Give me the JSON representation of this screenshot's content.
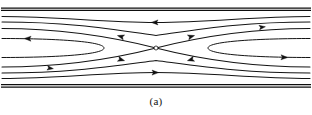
{
  "figure": {
    "caption": "(a)",
    "colors": {
      "background": "#ffffff",
      "stroke": "#141414",
      "wall": "#0d0d0d",
      "arrow": "#101010",
      "null_point_fill": "#ffffff"
    },
    "canvas": {
      "width": 312,
      "height": 97
    },
    "null_point": {
      "x": 156,
      "y": 48,
      "radius": 2.0,
      "label": "X-point"
    },
    "walls": [
      {
        "name": "top-wall-outer",
        "y": 8.0,
        "thickness": 1.25
      },
      {
        "name": "top-wall-inner",
        "y": 10.3,
        "thickness": 1.25
      },
      {
        "name": "bottom-wall-inner",
        "y": 84.6,
        "thickness": 1.25
      },
      {
        "name": "bottom-wall-outer",
        "y": 87.0,
        "thickness": 1.25
      }
    ],
    "streamlines": [
      {
        "name": "upper-outer-streamline",
        "d": "M 2,16.5 C 60,16.5 100,22.5 156,22.5 C 212,22.5 252,16.5 310,16.5",
        "direction": "leftward"
      },
      {
        "name": "upper-separatrix-left",
        "d": "M 2,28.5 C 55,28.5 105,35.0 156,48.0",
        "direction": "leftward"
      },
      {
        "name": "upper-separatrix-right",
        "d": "M 156,48.0 C 207,35.0 257,28.5 310,28.5",
        "direction": "rightward"
      },
      {
        "name": "lower-separatrix-left",
        "d": "M 2,67.0 C 55,67.0 105,61.0 156,48.0",
        "direction": "rightward"
      },
      {
        "name": "lower-separatrix-right",
        "d": "M 156,48.0 C 207,61.0 257,67.0 310,67.0",
        "direction": "leftward"
      },
      {
        "name": "lower-outer-streamline",
        "d": "M 2,78.5 C 60,78.5 100,72.5 156,72.5 C 212,72.5 252,78.5 310,78.5",
        "direction": "rightward"
      },
      {
        "name": "upper-mid-streamline",
        "d": "M 2,22.0 C 70,22.0 110,29.0 156,35.5 C 202,29.0 242,22.0 310,22.0",
        "direction": "leftward"
      },
      {
        "name": "lower-mid-streamline",
        "d": "M 2,73.0 C 70,73.0 110,66.5 156,60.5 C 202,66.5 242,73.0 310,73.0",
        "direction": "rightward"
      }
    ],
    "recirculation_loops": [
      {
        "name": "left-loop",
        "d": "M 2,38.5 C 50,38.5 104,41.0 104,48.0 C 104,55.0 50,57.5 2,57.5",
        "side": "left"
      },
      {
        "name": "right-loop",
        "d": "M 310,38.5 C 262,38.5 208,41.0 208,48.0 C 208,55.0 262,57.5 310,57.5",
        "side": "right"
      }
    ],
    "arrows": [
      {
        "name": "arrow-top-center",
        "x": 155,
        "y": 22.4,
        "angle": 180,
        "size": 6.0,
        "on": "upper-outer-streamline"
      },
      {
        "name": "arrow-bottom-center",
        "x": 155,
        "y": 72.6,
        "angle": 0,
        "size": 6.0,
        "on": "lower-outer-streamline"
      },
      {
        "name": "arrow-upper-left-inflow",
        "x": 121,
        "y": 36.6,
        "angle": 196,
        "size": 6.0,
        "on": "upper-separatrix-left"
      },
      {
        "name": "arrow-upper-right-outflow",
        "x": 191,
        "y": 36.6,
        "angle": 344,
        "size": 6.0,
        "on": "upper-separatrix-right"
      },
      {
        "name": "arrow-lower-left-outflow",
        "x": 121,
        "y": 59.6,
        "angle": 16,
        "size": 6.0,
        "on": "lower-separatrix-left"
      },
      {
        "name": "arrow-lower-right-inflow",
        "x": 191,
        "y": 59.6,
        "angle": 164,
        "size": 6.0,
        "on": "lower-separatrix-right"
      },
      {
        "name": "arrow-left-loop-return",
        "x": 28,
        "y": 38.6,
        "angle": 182,
        "size": 6.0,
        "on": "left-loop"
      },
      {
        "name": "arrow-right-loop-return",
        "x": 284,
        "y": 57.4,
        "angle": 2,
        "size": 6.0,
        "on": "right-loop"
      },
      {
        "name": "arrow-upper-right-far",
        "x": 262,
        "y": 27.2,
        "angle": 352,
        "size": 5.5,
        "on": "upper-separatrix-right"
      },
      {
        "name": "arrow-lower-left-far",
        "x": 50,
        "y": 68.2,
        "angle": 8,
        "size": 5.5,
        "on": "lower-separatrix-left"
      }
    ]
  }
}
